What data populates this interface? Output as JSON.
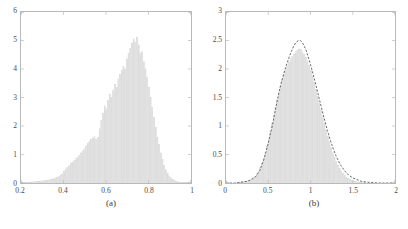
{
  "figure": {
    "background_color": "#ffffff",
    "axis_color": "#b9b9b9",
    "bar_edge_color": "#c8c8c8",
    "curve_color": "#555555"
  },
  "panels": [
    {
      "caption": "(a)",
      "chart_data": {
        "type": "bar",
        "title": "",
        "xlabel": "",
        "ylabel": "",
        "xlim": [
          0.2,
          1.0
        ],
        "ylim": [
          0,
          6
        ],
        "grid": false,
        "legend": false,
        "xticks": [
          0.2,
          0.4,
          0.6,
          0.8,
          1
        ],
        "xtick_labels": [
          "0.2",
          "0.4",
          "0.6",
          "0.8",
          "1"
        ],
        "yticks": [
          0,
          1,
          2,
          3,
          4,
          5,
          6
        ],
        "ytick_labels": [
          "0",
          "1",
          "2",
          "3",
          "4",
          "5",
          "6"
        ],
        "bin_width": 0.008,
        "x": [
          0.204,
          0.212,
          0.22,
          0.228,
          0.236,
          0.244,
          0.252,
          0.26,
          0.268,
          0.276,
          0.284,
          0.292,
          0.3,
          0.308,
          0.316,
          0.324,
          0.332,
          0.34,
          0.348,
          0.356,
          0.364,
          0.372,
          0.38,
          0.388,
          0.396,
          0.404,
          0.412,
          0.42,
          0.428,
          0.436,
          0.444,
          0.452,
          0.46,
          0.468,
          0.476,
          0.484,
          0.492,
          0.5,
          0.508,
          0.516,
          0.524,
          0.532,
          0.54,
          0.548,
          0.556,
          0.564,
          0.572,
          0.58,
          0.588,
          0.596,
          0.604,
          0.612,
          0.62,
          0.628,
          0.636,
          0.644,
          0.652,
          0.66,
          0.668,
          0.676,
          0.684,
          0.692,
          0.7,
          0.708,
          0.716,
          0.724,
          0.732,
          0.74,
          0.748,
          0.756,
          0.764,
          0.772,
          0.78,
          0.788,
          0.796,
          0.804,
          0.812,
          0.82,
          0.828,
          0.836,
          0.844,
          0.852,
          0.86,
          0.868,
          0.876,
          0.884,
          0.892,
          0.9,
          0.908,
          0.916,
          0.924,
          0.932,
          0.94,
          0.948,
          0.956,
          0.964,
          0.972,
          0.98,
          0.988,
          0.996
        ],
        "values": [
          0.01,
          0.01,
          0.02,
          0.02,
          0.02,
          0.03,
          0.03,
          0.04,
          0.04,
          0.05,
          0.05,
          0.06,
          0.07,
          0.07,
          0.08,
          0.09,
          0.1,
          0.12,
          0.13,
          0.15,
          0.17,
          0.2,
          0.22,
          0.26,
          0.32,
          0.4,
          0.48,
          0.55,
          0.6,
          0.68,
          0.72,
          0.78,
          0.85,
          0.9,
          0.97,
          1.05,
          1.12,
          1.2,
          1.3,
          1.38,
          1.45,
          1.52,
          1.58,
          1.62,
          1.52,
          1.6,
          1.9,
          2.2,
          2.45,
          2.7,
          2.6,
          2.9,
          3.1,
          3.0,
          3.25,
          3.45,
          3.35,
          3.65,
          3.8,
          3.95,
          4.1,
          4.0,
          4.35,
          4.55,
          4.72,
          4.9,
          5.05,
          4.95,
          5.1,
          4.85,
          4.55,
          4.6,
          4.25,
          4.0,
          3.7,
          3.35,
          3.0,
          2.65,
          2.3,
          1.95,
          1.6,
          1.35,
          1.05,
          0.82,
          0.62,
          0.46,
          0.34,
          0.25,
          0.18,
          0.13,
          0.09,
          0.06,
          0.04,
          0.03,
          0.02,
          0.02,
          0.01,
          0.01,
          0.01,
          0.0
        ]
      }
    },
    {
      "caption": "(b)",
      "chart_data": {
        "type": "bar",
        "title": "",
        "xlabel": "",
        "ylabel": "",
        "xlim": [
          0,
          2
        ],
        "ylim": [
          0,
          3
        ],
        "grid": false,
        "legend": false,
        "xticks": [
          0,
          0.5,
          1,
          1.5,
          2
        ],
        "xtick_labels": [
          "0",
          "0.5",
          "1",
          "1.5",
          "2"
        ],
        "yticks": [
          0,
          0.5,
          1,
          1.5,
          2,
          2.5,
          3
        ],
        "ytick_labels": [
          "0",
          "0.5",
          "1",
          "1.5",
          "2",
          "2.5",
          "3"
        ],
        "bin_width": 0.02,
        "x": [
          0.01,
          0.03,
          0.05,
          0.07,
          0.09,
          0.11,
          0.13,
          0.15,
          0.17,
          0.19,
          0.21,
          0.23,
          0.25,
          0.27,
          0.29,
          0.31,
          0.33,
          0.35,
          0.37,
          0.39,
          0.41,
          0.43,
          0.45,
          0.47,
          0.49,
          0.51,
          0.53,
          0.55,
          0.57,
          0.59,
          0.61,
          0.63,
          0.65,
          0.67,
          0.69,
          0.71,
          0.73,
          0.75,
          0.77,
          0.79,
          0.81,
          0.83,
          0.85,
          0.87,
          0.89,
          0.91,
          0.93,
          0.95,
          0.97,
          0.99,
          1.01,
          1.03,
          1.05,
          1.07,
          1.09,
          1.11,
          1.13,
          1.15,
          1.17,
          1.19,
          1.21,
          1.23,
          1.25,
          1.27,
          1.29,
          1.31,
          1.33,
          1.35,
          1.37,
          1.39,
          1.41,
          1.43,
          1.45,
          1.47,
          1.49,
          1.51,
          1.53,
          1.55,
          1.57,
          1.59,
          1.61,
          1.63,
          1.65,
          1.67,
          1.69,
          1.71,
          1.73,
          1.75,
          1.77,
          1.79,
          1.81,
          1.83,
          1.85,
          1.87,
          1.89,
          1.91,
          1.93,
          1.95,
          1.97,
          1.99
        ],
        "values": [
          0.0,
          0.0,
          0.0,
          0.0,
          0.0,
          0.0,
          0.0,
          0.01,
          0.01,
          0.01,
          0.02,
          0.02,
          0.03,
          0.04,
          0.05,
          0.07,
          0.09,
          0.12,
          0.16,
          0.21,
          0.27,
          0.34,
          0.43,
          0.53,
          0.64,
          0.77,
          0.9,
          1.04,
          1.18,
          1.32,
          1.46,
          1.58,
          1.7,
          1.81,
          1.9,
          1.98,
          2.05,
          2.12,
          2.18,
          2.22,
          2.26,
          2.3,
          2.33,
          2.35,
          2.34,
          2.3,
          2.26,
          2.2,
          2.14,
          2.06,
          1.97,
          1.87,
          1.76,
          1.64,
          1.52,
          1.4,
          1.28,
          1.16,
          1.04,
          0.93,
          0.82,
          0.72,
          0.62,
          0.53,
          0.45,
          0.38,
          0.31,
          0.26,
          0.21,
          0.17,
          0.13,
          0.1,
          0.08,
          0.06,
          0.05,
          0.04,
          0.03,
          0.02,
          0.02,
          0.01,
          0.01,
          0.01,
          0.01,
          0.0,
          0.0,
          0.0,
          0.0,
          0.0,
          0.0,
          0.0,
          0.0,
          0.0,
          0.0,
          0.0,
          0.0,
          0.0,
          0.0,
          0.0,
          0.0,
          0.0
        ],
        "overlay_curve": {
          "style": "dashed",
          "x": [
            0.0,
            0.05,
            0.1,
            0.15,
            0.2,
            0.25,
            0.3,
            0.35,
            0.4,
            0.45,
            0.5,
            0.55,
            0.6,
            0.62,
            0.65,
            0.7,
            0.75,
            0.78,
            0.8,
            0.83,
            0.86,
            0.88,
            0.9,
            0.92,
            0.95,
            1.0,
            1.05,
            1.1,
            1.15,
            1.2,
            1.25,
            1.3,
            1.35,
            1.4,
            1.45,
            1.5,
            1.6,
            1.7,
            1.8,
            1.9,
            2.0
          ],
          "values": [
            0.0,
            0.0,
            0.0,
            0.01,
            0.02,
            0.03,
            0.06,
            0.11,
            0.22,
            0.42,
            0.7,
            1.02,
            1.4,
            1.54,
            1.74,
            2.0,
            2.22,
            2.33,
            2.4,
            2.47,
            2.5,
            2.5,
            2.47,
            2.42,
            2.32,
            2.08,
            1.8,
            1.5,
            1.2,
            0.92,
            0.68,
            0.48,
            0.33,
            0.22,
            0.14,
            0.09,
            0.03,
            0.01,
            0.0,
            0.0,
            0.0
          ]
        }
      }
    }
  ]
}
